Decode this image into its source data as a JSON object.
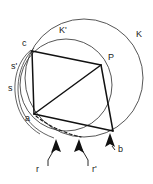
{
  "figure": {
    "type": "geometry-diagram",
    "width": 153,
    "height": 184,
    "background_color": "#ffffff",
    "stroke_color": "#111111",
    "thin_stroke_color": "#2b2b2b"
  },
  "labels": {
    "circle_outer": "K",
    "circle_inner": "K'",
    "vertex_top_left": "c",
    "vertex_right": "P",
    "vertex_bottom_left": "a",
    "vertex_bottom_right": "b",
    "arc_upper_left": "s'",
    "arc_lower_left": "s",
    "arrow_left": "r",
    "arrow_middle": "r'",
    "arrow_right": "b"
  },
  "label_positions": {
    "circle_outer": {
      "x": 136,
      "y": 37
    },
    "circle_inner": {
      "x": 59,
      "y": 33
    },
    "vertex_top_left": {
      "x": 22,
      "y": 46
    },
    "vertex_right": {
      "x": 108,
      "y": 60
    },
    "vertex_bottom_left": {
      "x": 25,
      "y": 121
    },
    "vertex_bottom_right": {
      "x": 118,
      "y": 152
    },
    "arc_upper_left": {
      "x": 11,
      "y": 69
    },
    "arc_lower_left": {
      "x": 8,
      "y": 91
    },
    "arrow_left": {
      "x": 36,
      "y": 172
    },
    "arrow_middle": {
      "x": 92,
      "y": 172
    }
  },
  "geometry": {
    "circle_K": {
      "cx": 84,
      "cy": 78,
      "r": 59
    },
    "circle_K_prime": {
      "cx": 66,
      "cy": 85,
      "r": 46
    },
    "points": {
      "c": {
        "x": 32,
        "y": 51
      },
      "P": {
        "x": 101,
        "y": 65
      },
      "a": {
        "x": 34,
        "y": 114
      },
      "b": {
        "x": 113,
        "y": 131
      }
    },
    "chords": [
      {
        "name": "c-P",
        "from": "c",
        "to": "P"
      },
      {
        "name": "c-a",
        "from": "c",
        "to": "a"
      },
      {
        "name": "a-P",
        "from": "a",
        "to": "P"
      },
      {
        "name": "P-b",
        "from": "P",
        "to": "b"
      },
      {
        "name": "a-b",
        "from": "a",
        "to": "b"
      }
    ]
  },
  "arrows": [
    {
      "name": "r",
      "tip_x": 56,
      "tip_y": 140,
      "tail_x": 48,
      "tail_y": 163
    },
    {
      "name": "r-prime",
      "tip_x": 79,
      "tip_y": 140,
      "tail_x": 86,
      "tail_y": 163
    },
    {
      "name": "b",
      "tip_x": 110,
      "tip_y": 134,
      "tail_x": 117,
      "tail_y": 148
    }
  ]
}
